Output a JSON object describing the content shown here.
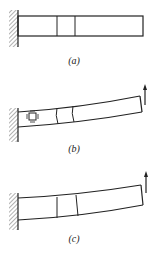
{
  "figure": {
    "panels": [
      {
        "id": "a",
        "label": "(a)",
        "description": "Undeformed cantilever beam fixed at left wall with a marked element"
      },
      {
        "id": "b",
        "label": "(b)",
        "description": "Cantilever deflected by upward end force; small square stress element shown near support"
      },
      {
        "id": "c",
        "label": "(c)",
        "description": "Cantilever deflected by upward end force with plane cross-sections"
      }
    ],
    "colors": {
      "line": "#222222",
      "hatch": "#555555",
      "background": "#ffffff"
    }
  }
}
